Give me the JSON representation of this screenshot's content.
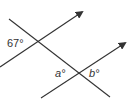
{
  "diagram": {
    "type": "parallel-lines-transversal",
    "line_color": "#333333",
    "labels": {
      "given_angle": "67°",
      "angle_a": "a°",
      "angle_b": "b°"
    },
    "lines": [
      {
        "name": "upper-parallel-line",
        "x1": 0,
        "y1": 67,
        "x2": 82,
        "y2": 12,
        "arrow": true
      },
      {
        "name": "lower-parallel-line",
        "x1": 41,
        "y1": 98,
        "x2": 125,
        "y2": 43,
        "arrow": true
      },
      {
        "name": "transversal-line",
        "x1": 9,
        "y1": 19,
        "x2": 110,
        "y2": 97,
        "arrow": false
      }
    ]
  }
}
